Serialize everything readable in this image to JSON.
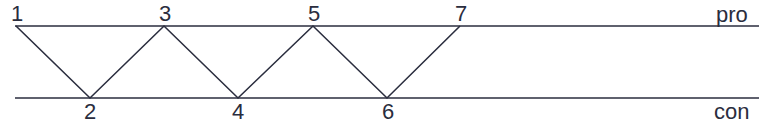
{
  "diagram": {
    "lines": {
      "top": {
        "label": "pro",
        "y": 26,
        "x1": 15,
        "x2": 759
      },
      "bottom": {
        "label": "con",
        "y": 98,
        "x1": 15,
        "x2": 759
      }
    },
    "nodes": [
      {
        "id": "1",
        "label": "1",
        "x": 16,
        "y": 26,
        "line": "pro"
      },
      {
        "id": "2",
        "label": "2",
        "x": 90,
        "y": 98,
        "line": "con"
      },
      {
        "id": "3",
        "label": "3",
        "x": 164,
        "y": 26,
        "line": "pro"
      },
      {
        "id": "4",
        "label": "4",
        "x": 238,
        "y": 98,
        "line": "con"
      },
      {
        "id": "5",
        "label": "5",
        "x": 313,
        "y": 26,
        "line": "pro"
      },
      {
        "id": "6",
        "label": "6",
        "x": 387,
        "y": 98,
        "line": "con"
      },
      {
        "id": "7",
        "label": "7",
        "x": 460,
        "y": 26,
        "line": "pro"
      }
    ],
    "edges": [
      [
        "1",
        "2"
      ],
      [
        "2",
        "3"
      ],
      [
        "3",
        "4"
      ],
      [
        "4",
        "5"
      ],
      [
        "5",
        "6"
      ],
      [
        "6",
        "7"
      ]
    ],
    "colors": {
      "stroke": "#2a2d3e",
      "background": "#ffffff"
    }
  }
}
